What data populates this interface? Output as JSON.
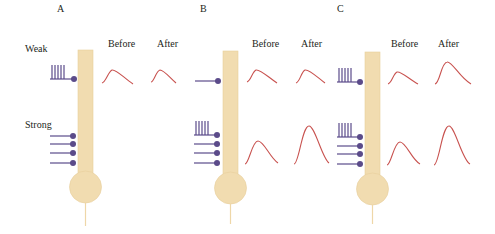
{
  "panels": [
    {
      "letter": "A",
      "header_before": "Before",
      "header_after": "After",
      "weak_label": "Weak",
      "strong_label": "Strong",
      "weak_input": "repetitive (tetanic) stimulation",
      "strong_input": "4 single synapses",
      "weak_response": {
        "before": "small",
        "after": "small"
      },
      "strong_response": {
        "before": "none shown",
        "after": "none shown"
      }
    },
    {
      "letter": "B",
      "header_before": "Before",
      "header_after": "After",
      "weak_input": "single synapse",
      "strong_input": "repetitive (tetanic) stimulation + 4 synapses",
      "weak_response": {
        "before": "small",
        "after": "small"
      },
      "strong_response": {
        "before": "medium",
        "after": "large"
      }
    },
    {
      "letter": "C",
      "header_before": "Before",
      "header_after": "After",
      "weak_input": "repetitive (tetanic) stimulation",
      "strong_input": "repetitive (tetanic) stimulation + 4 synapses",
      "weak_response": {
        "before": "small",
        "after": "enlarged"
      },
      "strong_response": {
        "before": "medium",
        "after": "large"
      }
    }
  ],
  "colors": {
    "neuron": "#f1dcb0",
    "neuron_edge": "#e6c990",
    "axon_input": "#5b4b8a",
    "trace": "#c8524f",
    "text": "#231f20"
  }
}
